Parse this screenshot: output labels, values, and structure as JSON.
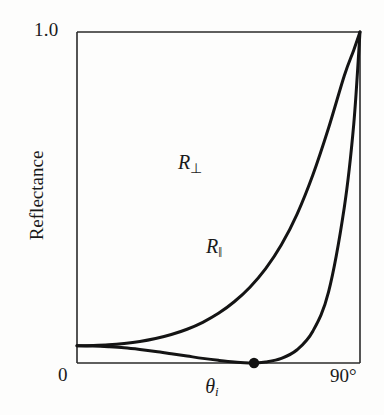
{
  "figure": {
    "background_color": "#fdfdfc",
    "ink_color": "#1a1a1a"
  },
  "axes": {
    "y_tick_top": "1.0",
    "y_tick_bottom": "0",
    "x_tick_right": "90°",
    "y_axis_label": "Reflectance",
    "x_axis_label_symbol": "θ",
    "x_axis_label_subscript": "i"
  },
  "annotations": {
    "perp_symbol": "R",
    "perp_subscript": "⊥",
    "par_symbol": "R",
    "par_subscript": "‖",
    "brewster_point_name": "brewster-angle-marker"
  },
  "chart_data": {
    "type": "line",
    "title": "",
    "xlabel": "θi",
    "ylabel": "Reflectance",
    "xlim": [
      0,
      90
    ],
    "ylim": [
      0,
      1.0
    ],
    "xtick_labels": [
      "0",
      "90°"
    ],
    "ytick_labels": [
      "0",
      "1.0"
    ],
    "grid": false,
    "legend": "inline-curve-labels",
    "series": [
      {
        "name": "R⊥",
        "label": "R_perpendicular",
        "x": [
          0,
          5,
          10,
          15,
          20,
          25,
          30,
          35,
          40,
          45,
          50,
          55,
          60,
          65,
          70,
          75,
          80,
          85,
          88,
          90
        ],
        "values": [
          0.052,
          0.053,
          0.055,
          0.059,
          0.065,
          0.074,
          0.086,
          0.102,
          0.123,
          0.15,
          0.185,
          0.229,
          0.285,
          0.357,
          0.45,
          0.568,
          0.71,
          0.868,
          0.945,
          1.0
        ]
      },
      {
        "name": "R‖",
        "label": "R_parallel",
        "x": [
          0,
          5,
          10,
          15,
          20,
          25,
          30,
          35,
          40,
          45,
          50,
          55,
          56.3,
          60,
          65,
          70,
          75,
          80,
          85,
          88,
          90
        ],
        "values": [
          0.052,
          0.051,
          0.049,
          0.046,
          0.041,
          0.035,
          0.028,
          0.021,
          0.014,
          0.008,
          0.003,
          0.0002,
          0.0,
          0.003,
          0.014,
          0.04,
          0.096,
          0.215,
          0.47,
          0.72,
          1.0
        ]
      }
    ],
    "markers": [
      {
        "name": "brewster-angle",
        "series": "R‖",
        "x": 56.3,
        "y": 0.0,
        "style": "filled-circle"
      }
    ]
  }
}
